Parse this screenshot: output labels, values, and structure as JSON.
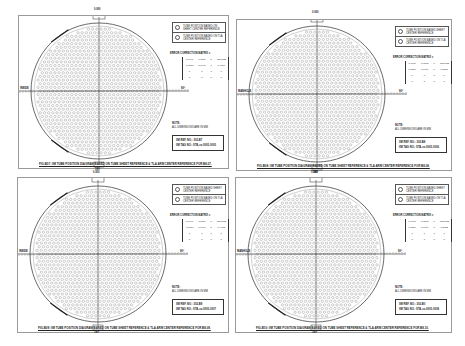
{
  "panels": [
    {
      "legend": [
        "TUBE POSITION BASED ON SHEET CENTER REFERENCE",
        "TUBE POSITION BASED ON TLA CENTER REFERENCE"
      ],
      "error_title": "ERROR CORRECTION MATRIX =",
      "matrix": [
        [
          "0.9997",
          "0.0087",
          "0",
          "-55.0982"
        ],
        [
          "-0.0087",
          "0.9997",
          "0",
          "0.4867"
        ],
        [
          "0",
          "0",
          "1",
          "0"
        ],
        [
          "0",
          "0",
          "0",
          "1"
        ]
      ],
      "note_title": "NOTE:",
      "note_text": "ALL DIMENSIONS ARE IN MM",
      "ref_no": "IIM REF. NO.: 302-B7",
      "tag_no": "IIM TAG NO.: STA-xx-0005-0005",
      "caption": "FIG-B07: IIM TUBE POSITION DIAGRAM BASED ON TUBE SHEET REFERENCE & TLA ARM CENTER REFERENCE FOR B8-07.",
      "labels": {
        "top": "0.000",
        "left": "INSIDE",
        "right": "90°",
        "bottom": "180°"
      }
    },
    {
      "legend": [
        "TUBE POSITION BASED SHEET CENTER REFERENCE",
        "TUBE POSITION BASED ON TLA CENTER REFERENCE"
      ],
      "error_title": "ERROR CORRECTION MATRIX =",
      "matrix": [
        [
          "0.9998",
          "-0.0087",
          "0",
          "-55.0982"
        ],
        [
          "0.0087",
          "0.9998",
          "0",
          "0.3895"
        ],
        [
          "0",
          "0",
          "1",
          "0"
        ],
        [
          "0",
          "0",
          "0",
          "1"
        ]
      ],
      "note_title": "NOTE:",
      "note_text": "ALL DIMENSIONS ARE IN MM",
      "ref_no": "IIM REF. NO.: 302-B8",
      "tag_no": "IIM TAG NO.: STA-xx-0005-0006",
      "caption": "FIG-B08: IIM TUBE POSITION DIAGRAM BASED ON TUBE SHEET REFERENCE & TLA ARM CENTER REFERENCE FOR B8-08.",
      "labels": {
        "top": "0.000",
        "left": "MANHOLE",
        "right": "90°",
        "bottom": "180°"
      }
    },
    {
      "legend": [
        "TUBE POSITION BASED SHEET CENTER REFERENCE",
        "TUBE POSITION BASED ON TLA CENTER REFERENCE"
      ],
      "error_title": "ERROR CORRECTION MATRIX =",
      "matrix": [
        [
          "0.9996",
          "0.0089",
          "0",
          "-55.0982"
        ],
        [
          "-0.0089",
          "0.9996",
          "0",
          "0.4402"
        ],
        [
          "0",
          "0",
          "1",
          "0"
        ],
        [
          "0",
          "0",
          "0",
          "1"
        ]
      ],
      "note_title": "NOTE:",
      "note_text": "ALL DIMENSIONS ARE IN MM",
      "ref_no": "IIM REF. NO.: 302-B9",
      "tag_no": "IIM TAG NO.: STA-xx-0005-0007",
      "caption": "FIG-B09: IIM TUBE POSITION DIAGRAM BASED ON TUBE SHEET REFERENCE & TLA ARM CENTER REFERENCE FOR B8-09.",
      "labels": {
        "top": "0.000",
        "left": "INSIDE",
        "right": "90°",
        "bottom": "180°"
      }
    },
    {
      "legend": [
        "TUBE POSITION BASED SHEET CENTER REFERENCE",
        "TUBE POSITION BASED ON TLA CENTER REFERENCE"
      ],
      "error_title": "ERROR CORRECTION MATRIX =",
      "matrix": [
        [
          "0.9998",
          "-0.0086",
          "0",
          "-55.0982"
        ],
        [
          "0.0086",
          "0.9998",
          "0",
          "0.3812"
        ],
        [
          "0",
          "0",
          "1",
          "0"
        ],
        [
          "0",
          "0",
          "0",
          "1"
        ]
      ],
      "note_title": "NOTE:",
      "note_text": "ALL DIMENSIONS ARE IN MM",
      "ref_no": "IIM REF. NO.: 302-B0",
      "tag_no": "IIM TAG NO.: STA-xx-0005-0008",
      "caption": "FIG-B10: IIM TUBE POSITION DIAGRAM BASED ON TUBE SHEET REFERENCE & TLA ARM CENTER REFERENCE FOR B8-10.",
      "labels": {
        "top": "0.000",
        "left": "MANHOLE",
        "right": "90°",
        "bottom": "180°"
      }
    }
  ]
}
